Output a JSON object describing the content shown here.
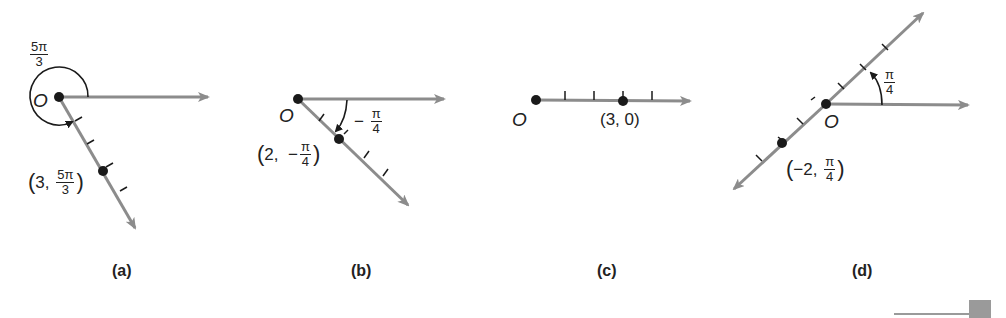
{
  "figure": {
    "colors": {
      "ray": "#8c8c8c",
      "ink": "#1a1a1a",
      "corner_block": "#9a9a9a"
    },
    "panels": [
      {
        "id": "a",
        "caption": "(a)",
        "pole_label": "O",
        "angle_label": {
          "num": "5π",
          "den": "3"
        },
        "point_label": {
          "r": "3",
          "theta_num": "5π",
          "theta_den": "3"
        },
        "r": 3,
        "theta": "5π/3"
      },
      {
        "id": "b",
        "caption": "(b)",
        "pole_label": "O",
        "angle_label": {
          "sign": "−",
          "num": "π",
          "den": "4"
        },
        "point_label": {
          "r": "2",
          "sign": "−",
          "theta_num": "π",
          "theta_den": "4"
        },
        "r": 2,
        "theta": "−π/4"
      },
      {
        "id": "c",
        "caption": "(c)",
        "pole_label": "O",
        "point_label": {
          "text": "(3, 0)"
        },
        "r": 3,
        "theta": "0"
      },
      {
        "id": "d",
        "caption": "(d)",
        "pole_label": "O",
        "angle_label": {
          "num": "π",
          "den": "4"
        },
        "point_label": {
          "r": "−2",
          "theta_num": "π",
          "theta_den": "4"
        },
        "r": -2,
        "theta": "π/4"
      }
    ]
  }
}
